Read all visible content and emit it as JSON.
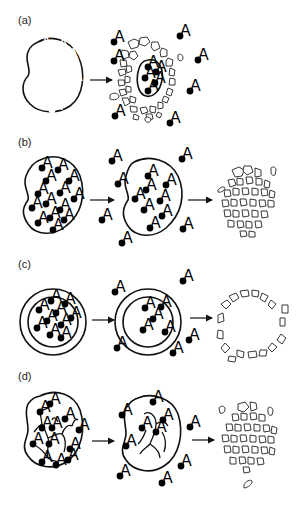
{
  "figure": {
    "panels": [
      {
        "id": "a",
        "label": "(a)",
        "description": "Particle surface erosion: outer matrix fragments while core still holds agent A"
      },
      {
        "id": "b",
        "label": "(b)",
        "description": "Bulk erosion: agent A diffuses out, then whole particle fragments"
      },
      {
        "id": "c",
        "label": "(c)",
        "description": "Reservoir (core-shell) system: agent A diffuses through shell, then shell fragments"
      },
      {
        "id": "d",
        "label": "(d)",
        "description": "Polymer-drug conjugate: chains cleave releasing agent A, then matrix fragments"
      }
    ],
    "molecule_label": "A",
    "arrow_symbol": "→"
  }
}
